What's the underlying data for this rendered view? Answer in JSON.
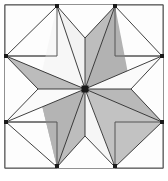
{
  "figure": {
    "kind": "line-drawing",
    "background_color": "#ffffff",
    "caption_mark": ""
  },
  "frame": {
    "label": "block-border",
    "x": 5,
    "y": 5,
    "width": 158,
    "height": 163,
    "stroke_color": "#4a4a4a",
    "fill_color": "#ffffff",
    "stroke_width": 1.2
  },
  "palette": {
    "shaded_diamond": "#b9b9b9",
    "light_diamond": "#f7f7f7",
    "background_patch": "#fdfdfd",
    "outline": "#2b2b2b",
    "frame_outline": "#4a4a4a",
    "center_dot": "#1a1a1a",
    "page_background": "#ffffff"
  },
  "geometry": {
    "center": {
      "x": 85,
      "y": 89
    },
    "point_count": 8,
    "tip_labels": [
      "N",
      "NE",
      "E",
      "SE",
      "S",
      "SW",
      "W",
      "NW"
    ],
    "tips": [
      {
        "name": "tip-north-left",
        "x": 57,
        "y": 6
      },
      {
        "name": "tip-north-right",
        "x": 115,
        "y": 6
      },
      {
        "name": "tip-east-top",
        "x": 162,
        "y": 56
      },
      {
        "name": "tip-east-bottom",
        "x": 162,
        "y": 122
      },
      {
        "name": "tip-south-right",
        "x": 115,
        "y": 167
      },
      {
        "name": "tip-south-left",
        "x": 57,
        "y": 167
      },
      {
        "name": "tip-west-bottom",
        "x": 6,
        "y": 122
      },
      {
        "name": "tip-west-top",
        "x": 6,
        "y": 56
      }
    ],
    "notches": [
      {
        "name": "notch-north",
        "x": 85,
        "y": 38
      },
      {
        "name": "notch-east",
        "x": 131,
        "y": 89
      },
      {
        "name": "notch-south",
        "x": 85,
        "y": 136
      },
      {
        "name": "notch-west",
        "x": 38,
        "y": 89
      }
    ],
    "corner_squares": [
      {
        "name": "corner-top-left",
        "x": 5,
        "y": 5,
        "width": 52,
        "height": 51
      },
      {
        "name": "corner-top-right",
        "x": 115,
        "y": 5,
        "width": 48,
        "height": 51
      },
      {
        "name": "corner-bottom-left",
        "x": 5,
        "y": 122,
        "width": 52,
        "height": 46
      },
      {
        "name": "corner-bottom-right",
        "x": 115,
        "y": 122,
        "width": 48,
        "height": 46
      }
    ]
  },
  "diamonds": [
    {
      "name": "diamond-n-left",
      "index": 0,
      "shade": "light",
      "fill": "#f7f7f7",
      "tip": "tip-north-left",
      "side_a": "notch-west",
      "side_b": "notch-north"
    },
    {
      "name": "diamond-n-right",
      "index": 1,
      "shade": "shaded",
      "fill": "#b9b9b9",
      "tip": "tip-north-right",
      "side_a": "notch-north",
      "side_b": "notch-east"
    },
    {
      "name": "diamond-e-top",
      "index": 2,
      "shade": "light",
      "fill": "#f7f7f7",
      "tip": "tip-east-top",
      "side_a": "notch-north",
      "side_b": "notch-east"
    },
    {
      "name": "diamond-e-bot",
      "index": 3,
      "shade": "shaded",
      "fill": "#b9b9b9",
      "tip": "tip-east-bottom",
      "side_a": "notch-east",
      "side_b": "notch-south"
    },
    {
      "name": "diamond-s-right",
      "index": 4,
      "shade": "light",
      "fill": "#f7f7f7",
      "tip": "tip-south-right",
      "side_a": "notch-east",
      "side_b": "notch-south"
    },
    {
      "name": "diamond-s-left",
      "index": 5,
      "shade": "shaded",
      "fill": "#b9b9b9",
      "tip": "tip-south-left",
      "side_a": "notch-south",
      "side_b": "notch-west"
    },
    {
      "name": "diamond-w-bot",
      "index": 6,
      "shade": "light",
      "fill": "#f7f7f7",
      "tip": "tip-west-bottom",
      "side_a": "notch-south",
      "side_b": "notch-west"
    },
    {
      "name": "diamond-w-top",
      "index": 7,
      "shade": "shaded",
      "fill": "#b9b9b9",
      "tip": "tip-west-top",
      "side_a": "notch-west",
      "side_b": "notch-north"
    }
  ],
  "paths": {
    "frame_rect": "M5,5 L163,5 L163,168 L5,168 Z",
    "corner_tl": "M5,5 L57,5 L57,56 L5,56 Z",
    "corner_tr": "M115,5 L163,5 L163,56 L115,56 Z",
    "corner_bl": "M5,122 L57,122 L57,168 L5,168 Z",
    "corner_br": "M115,122 L163,122 L163,168 L115,168 Z",
    "notch_top": "M57,5 L115,5 L85,38 Z",
    "notch_right": "M163,56 L163,122 L131,89 Z",
    "notch_bottom": "M57,168 L115,168 L85,136 Z",
    "notch_left": "M5,56 L5,122 L38,89 Z",
    "star_outline": "M57,6 L85,38 L115,6 L162,56 L131,89 L162,122 L115,167 L85,136 L57,167 L6,122 L38,89 L6,56 Z",
    "d0": "M57,6 L38,89 L85,89 Z",
    "d0b": "M57,6 L85,89 L85,38 Z",
    "d1": "M115,6 L85,38 L85,89 Z",
    "d1b": "M115,6 L85,89 L131,89 Z",
    "d2": "M162,56 L85,89 L131,89 Z",
    "d2b": "M162,56 L131,89 L85,89 Z",
    "d3": "M162,122 L131,89 L85,89 Z",
    "d4": "M115,167 L85,89 L131,89 Z",
    "d4b": "M115,167 L85,136 L85,89 Z",
    "d5": "M57,167 L85,136 L85,89 Z",
    "d5b": "M57,167 L85,89 L38,89 Z",
    "d6": "M6,122 L38,89 L85,89 Z",
    "d7": "M6,56 L85,89 L38,89 Z"
  },
  "spokes": [
    {
      "name": "spoke-to-tip-n-left",
      "to_x": 57,
      "to_y": 6
    },
    {
      "name": "spoke-to-notch-n",
      "to_x": 85,
      "to_y": 38
    },
    {
      "name": "spoke-to-tip-n-right",
      "to_x": 115,
      "to_y": 6
    },
    {
      "name": "spoke-to-tip-e-top",
      "to_x": 162,
      "to_y": 56
    },
    {
      "name": "spoke-to-notch-e",
      "to_x": 131,
      "to_y": 89
    },
    {
      "name": "spoke-to-tip-e-bot",
      "to_x": 162,
      "to_y": 122
    },
    {
      "name": "spoke-to-tip-s-right",
      "to_x": 115,
      "to_y": 167
    },
    {
      "name": "spoke-to-notch-s",
      "to_x": 85,
      "to_y": 136
    },
    {
      "name": "spoke-to-tip-s-left",
      "to_x": 57,
      "to_y": 167
    },
    {
      "name": "spoke-to-tip-w-bot",
      "to_x": 6,
      "to_y": 122
    },
    {
      "name": "spoke-to-notch-w",
      "to_x": 38,
      "to_y": 89
    },
    {
      "name": "spoke-to-tip-w-top",
      "to_x": 6,
      "to_y": 56
    }
  ]
}
